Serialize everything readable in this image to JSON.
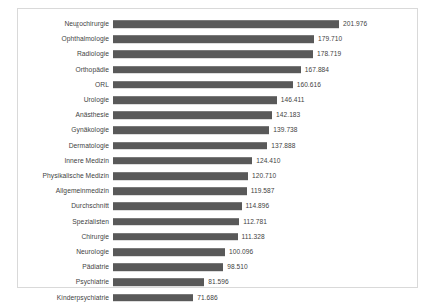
{
  "chart_data": {
    "type": "bar",
    "orientation": "horizontal",
    "title": "",
    "subtitle": "",
    "xlabel": "",
    "ylabel": "",
    "grid": false,
    "legend": null,
    "xlim": [
      0,
      201.976
    ],
    "value_format": "thousands-separator-dot",
    "bar_color": "#595959",
    "frame_color": "#d9d9d9",
    "text_color": "#3f3f3f",
    "categories": [
      "Neurochirurgie",
      "Ophthalmologie",
      "Radiologie",
      "Orthopädie",
      "ORL",
      "Urologie",
      "Anästhesie",
      "Gynäkologie",
      "Dermatologie",
      "Innere Medizin",
      "Physikalische Medizin",
      "Allgemeinmedizin",
      "Durchschnitt",
      "Spezialisten",
      "Chirurgie",
      "Neurologie",
      "Pädiatrie",
      "Psychiatrie",
      "Kinderpsychiatrie"
    ],
    "values": [
      201.976,
      179.71,
      178.719,
      167.884,
      160.616,
      146.411,
      142.183,
      139.738,
      137.888,
      124.41,
      120.71,
      119.587,
      114.896,
      112.781,
      111.328,
      100.096,
      98.51,
      81.596,
      71.686
    ],
    "value_labels": [
      "201.976",
      "179.710",
      "178.719",
      "167.884",
      "160.616",
      "146.411",
      "142.183",
      "139.738",
      "137.888",
      "124.410",
      "120.710",
      "119.587",
      "114.896",
      "112.781",
      "111.328",
      "100.096",
      "98.510",
      "81.596",
      "71.686"
    ]
  }
}
